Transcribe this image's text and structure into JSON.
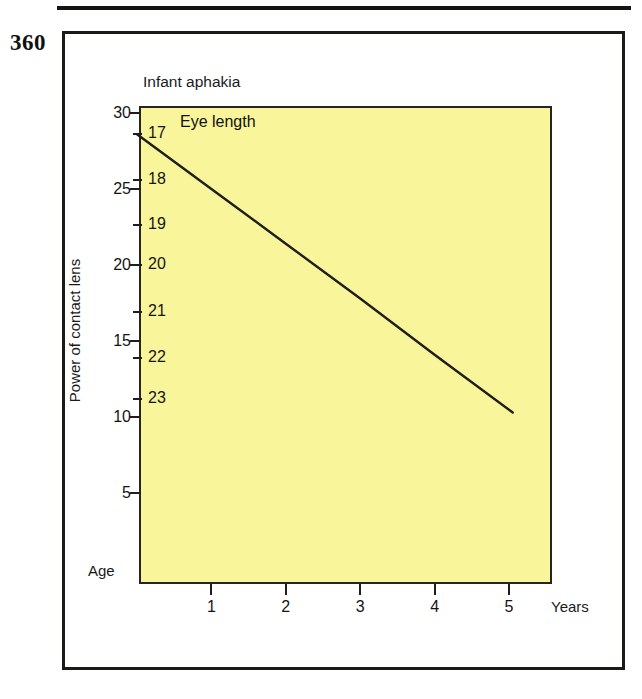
{
  "page": {
    "folio": "360",
    "rule": "horizontal-rule"
  },
  "figure": {
    "title": "Infant aphakia"
  },
  "chart_data": {
    "type": "line",
    "title": "Infant aphakia",
    "xlabel": "Age",
    "xunits": "Years",
    "ylabel": "Power of contact lens",
    "secondary_axis_label": "Eye length",
    "xlim": [
      0,
      5.55
    ],
    "ylim": [
      0,
      30
    ],
    "grid": false,
    "legend": "none",
    "x_tick_labels": [
      "1",
      "2",
      "3",
      "4",
      "5"
    ],
    "x_ticks": [
      1,
      2,
      3,
      4,
      5
    ],
    "y_tick_labels": [
      "30",
      "25",
      "20",
      "15",
      "10",
      "5"
    ],
    "y_ticks": [
      30,
      25,
      20,
      15,
      10,
      5
    ],
    "secondary_tick_labels": [
      "17",
      "18",
      "19",
      "20",
      "21",
      "22",
      "23"
    ],
    "secondary_ticks": [
      17,
      18,
      19,
      20,
      21,
      22,
      23
    ],
    "secondary_tick_power_values": [
      28.6,
      25.6,
      22.6,
      20.0,
      16.9,
      13.9,
      11.2
    ],
    "series": [
      {
        "name": "Power of contact lens vs age",
        "x": [
          0,
          1,
          2,
          3,
          4,
          5.05
        ],
        "y": [
          28.6,
          25.0,
          21.4,
          17.8,
          14.1,
          10.3
        ]
      }
    ],
    "annotations": [
      {
        "text": "Eye length",
        "x": 0.55,
        "y": 28.9
      },
      {
        "text": "Age",
        "x": -0.7,
        "y": 0.55
      },
      {
        "text": "Years",
        "x": 5.6,
        "y": -0.9
      }
    ],
    "colors": {
      "plot_background": "#f8f59b",
      "line": "#1f1e1a",
      "axis": "#262520",
      "text": "#141414",
      "frame": "#1b1a17"
    }
  }
}
